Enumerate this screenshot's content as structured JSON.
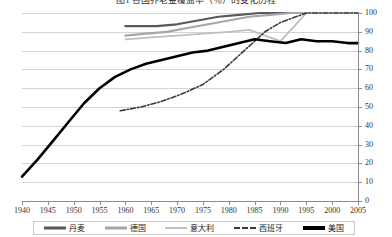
{
  "chart_data": {
    "type": "line",
    "title": "图1 各国养老金覆盖率（％）的变化历程",
    "xlabel": "",
    "ylabel": "",
    "xlim": [
      1940,
      2005
    ],
    "ylim": [
      0,
      100
    ],
    "grid": true,
    "legend_position": "bottom",
    "x_ticks": [
      1940,
      1945,
      1950,
      1955,
      1960,
      1965,
      1970,
      1975,
      1980,
      1985,
      1990,
      1995,
      2000,
      2005
    ],
    "y_ticks": [
      0,
      10,
      20,
      30,
      40,
      50,
      60,
      70,
      80,
      90,
      100
    ],
    "series": [
      {
        "name": "丹麦",
        "color": "#595959",
        "style": "solid",
        "width": 2.2,
        "x": [
          1960,
          1963,
          1966,
          1970,
          1974,
          1978,
          1982,
          1986,
          1990,
          1995,
          2000,
          2005
        ],
        "values": [
          93,
          93,
          93,
          94,
          96,
          98,
          99,
          100,
          100,
          100,
          100,
          100
        ]
      },
      {
        "name": "德国",
        "color": "#a6a6a6",
        "style": "solid",
        "width": 2.2,
        "x": [
          1960,
          1964,
          1968,
          1972,
          1976,
          1980,
          1984,
          1988,
          1992,
          1995,
          2000,
          2005
        ],
        "values": [
          88,
          89,
          90,
          92,
          94,
          96,
          98,
          99,
          100,
          100,
          100,
          100
        ]
      },
      {
        "name": "意大利",
        "color": "#bfbfbf",
        "style": "solid",
        "width": 1.8,
        "x": [
          1960,
          1965,
          1970,
          1975,
          1980,
          1984,
          1987,
          1990,
          1993,
          1995,
          2000,
          2005
        ],
        "values": [
          86,
          87,
          88,
          89,
          90,
          91,
          88,
          85,
          94,
          100,
          100,
          100
        ]
      },
      {
        "name": "西班牙",
        "color": "#3a3a3a",
        "style": "dash-dot",
        "width": 1.6,
        "x": [
          1959,
          1963,
          1967,
          1971,
          1975,
          1979,
          1983,
          1987,
          1990,
          1993,
          1995,
          2000,
          2005
        ],
        "values": [
          48,
          50,
          53,
          57,
          62,
          70,
          80,
          90,
          95,
          98,
          100,
          100,
          100
        ]
      },
      {
        "name": "美国",
        "color": "#000000",
        "style": "solid",
        "width": 2.6,
        "x": [
          1940,
          1943,
          1946,
          1949,
          1952,
          1955,
          1958,
          1961,
          1964,
          1967,
          1970,
          1973,
          1976,
          1979,
          1982,
          1985,
          1988,
          1991,
          1994,
          1997,
          2000,
          2003,
          2005
        ],
        "values": [
          13,
          22,
          32,
          42,
          52,
          60,
          66,
          70,
          73,
          75,
          77,
          79,
          80,
          82,
          84,
          86,
          85,
          84,
          86,
          85,
          85,
          84,
          84
        ]
      }
    ]
  },
  "legend": {
    "items": [
      {
        "label": "丹麦",
        "color": "#595959",
        "style": "solid",
        "thickness": 3
      },
      {
        "label": "德国",
        "color": "#a6a6a6",
        "style": "solid",
        "thickness": 3
      },
      {
        "label": "意大利",
        "color": "#bfbfbf",
        "style": "solid",
        "thickness": 2
      },
      {
        "label": "西班牙",
        "color": "#3a3a3a",
        "style": "dash-dot",
        "thickness": 2
      },
      {
        "label": "美国",
        "color": "#000000",
        "style": "solid",
        "thickness": 4
      }
    ]
  }
}
